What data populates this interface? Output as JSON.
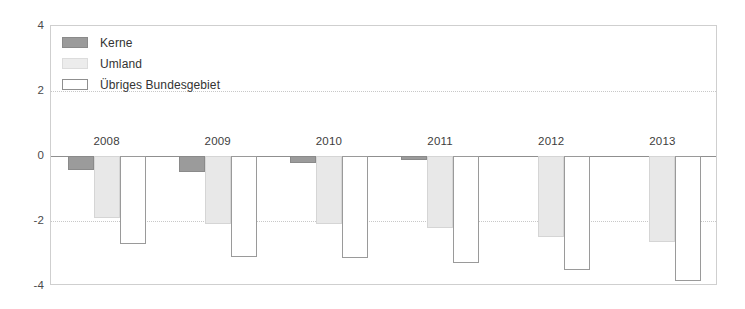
{
  "chart_data": {
    "type": "bar",
    "title": "",
    "subtitle": "",
    "xlabel": "",
    "ylabel": "",
    "categories": [
      "2008",
      "2009",
      "2010",
      "2011",
      "2012",
      "2013"
    ],
    "series": [
      {
        "name": "Kerne",
        "color": "#9b9b9b",
        "values": [
          -0.42,
          -0.5,
          -0.22,
          -0.13,
          0.0,
          0.0
        ]
      },
      {
        "name": "Umland",
        "color": "#e8e8e8",
        "values": [
          -1.9,
          -2.1,
          -2.1,
          -2.2,
          -2.5,
          -2.65
        ]
      },
      {
        "name": "Übriges Bundesgebiet",
        "color": "#ffffff",
        "values": [
          -2.7,
          -3.1,
          -3.15,
          -3.3,
          -3.5,
          -3.85
        ]
      }
    ],
    "ylim": [
      -4,
      4
    ],
    "y_ticks": [
      4,
      2,
      0,
      -2,
      -4
    ],
    "y_tick_labels": [
      "4",
      "2",
      "0",
      "-2",
      "-4"
    ],
    "grid": true,
    "grid_axis": "y",
    "legend_position": "top-left",
    "zero_line": true
  },
  "legend": {
    "items": [
      {
        "label": "Kerne",
        "swatch": "kerne"
      },
      {
        "label": "Umland",
        "swatch": "umland"
      },
      {
        "label": "Übriges Bundesgebiet",
        "swatch": "uebriges"
      }
    ]
  },
  "colors": {
    "kerne": "#9b9b9b",
    "umland": "#e8e8e8",
    "uebriges_bundesgebiet": "#ffffff",
    "grid": "#c8c8c8",
    "axis": "#8f8f8f",
    "text": "#3d3d3d",
    "background": "#ffffff"
  }
}
